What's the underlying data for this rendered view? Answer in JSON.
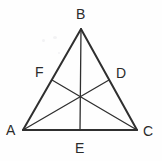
{
  "figure": {
    "background_color": "#fefefe",
    "stroke_color": "#2f2f2f",
    "label_color": "#2b2b2b",
    "outline_stroke_width": 2,
    "median_stroke_width": 1.3,
    "vertices": {
      "A": {
        "label": "A",
        "x": 23,
        "y": 130,
        "label_x": 6,
        "label_y": 123
      },
      "B": {
        "label": "B",
        "x": 81,
        "y": 29,
        "label_x": 76,
        "label_y": 7
      },
      "C": {
        "label": "C",
        "x": 137,
        "y": 130,
        "label_x": 143,
        "label_y": 124
      }
    },
    "midpoints": {
      "D": {
        "label": "D",
        "x": 109,
        "y": 80,
        "label_x": 116,
        "label_y": 66,
        "on_side": "BC"
      },
      "E": {
        "label": "E",
        "x": 80,
        "y": 130,
        "label_x": 75,
        "label_y": 141,
        "on_side": "AC"
      },
      "F": {
        "label": "F",
        "x": 52,
        "y": 80,
        "label_x": 35,
        "label_y": 65,
        "on_side": "AB"
      }
    },
    "centroid": {
      "x": 80,
      "y": 96
    },
    "sides": [
      {
        "name": "side-AB",
        "from": "A",
        "to": "B"
      },
      {
        "name": "side-BC",
        "from": "B",
        "to": "C"
      },
      {
        "name": "side-AC",
        "from": "A",
        "to": "C"
      }
    ],
    "medians": [
      {
        "name": "median-AD",
        "from": "A",
        "to": "D"
      },
      {
        "name": "median-BE",
        "from": "B",
        "to": "E"
      },
      {
        "name": "median-CF",
        "from": "C",
        "to": "F"
      }
    ]
  }
}
